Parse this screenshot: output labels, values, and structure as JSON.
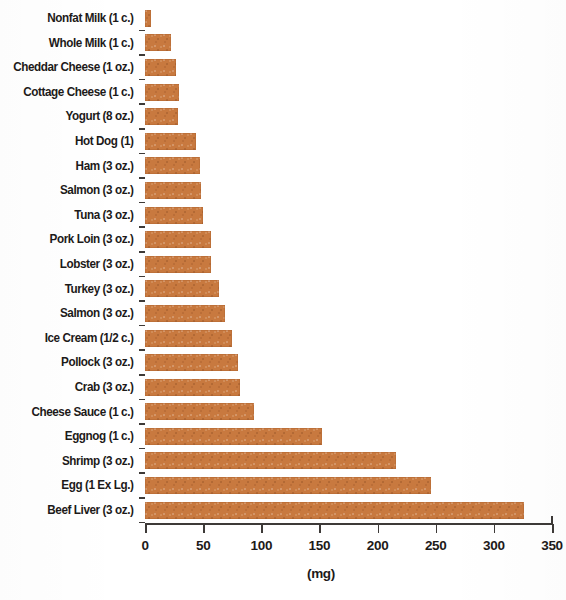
{
  "chart_data": {
    "type": "bar",
    "orientation": "horizontal",
    "title": "",
    "subtitle": "",
    "xlabel": "(mg)",
    "ylabel": "",
    "xlim": [
      0,
      350
    ],
    "xticks": [
      0,
      50,
      100,
      150,
      200,
      250,
      300,
      350
    ],
    "xtick_labels": [
      "0",
      "50",
      "100",
      "150",
      "200",
      "250",
      "300",
      "350"
    ],
    "grid": false,
    "legend": null,
    "bar_color": "#c8793f",
    "categories": [
      "Nonfat Milk (1 c.)",
      "Whole Milk (1 c.)",
      "Cheddar Cheese (1 oz.)",
      "Cottage Cheese (1 c.)",
      "Yogurt (8 oz.)",
      "Hot Dog (1)",
      "Ham (3 oz.)",
      "Salmon (3 oz.)",
      "Tuna (3 oz.)",
      "Pork Loin (3 oz.)",
      "Lobster (3 oz.)",
      "Turkey (3 oz.)",
      "Salmon (3 oz.)",
      "Ice Cream (1/2 c.)",
      "Pollock (3 oz.)",
      "Crab (3 oz.)",
      "Cheese Sauce (1 c.)",
      "Eggnog (1 c.)",
      "Shrimp (3 oz.)",
      "Egg (1 Ex Lg.)",
      "Beef Liver (3 oz.)"
    ],
    "values": [
      5,
      22,
      27,
      29,
      28,
      44,
      47,
      48,
      50,
      57,
      57,
      64,
      69,
      75,
      80,
      82,
      94,
      152,
      216,
      246,
      326
    ]
  }
}
